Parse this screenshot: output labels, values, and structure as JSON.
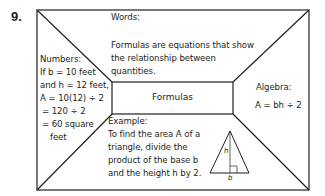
{
  "problem_number": "9.",
  "center": {
    "label": "Formulas"
  },
  "words": {
    "heading": "Words:",
    "lines": [
      "Formulas are equations that show",
      "the relationship between",
      "quantities."
    ]
  },
  "numbers": {
    "heading": "Numbers:",
    "lines": [
      "If b = 10 feet",
      "and h = 12 feet,",
      "A = 10(12) ÷ 2",
      "= 120 ÷ 2",
      "= 60 square",
      "feet"
    ]
  },
  "algebra": {
    "heading": "Algebra:",
    "formula": "A = bh ÷ 2"
  },
  "example": {
    "heading": "Example:",
    "lines": [
      "To find the area A of a",
      "triangle, divide the",
      "product of the base b",
      "and the height h by 2."
    ],
    "figure": {
      "shape": "isosceles-triangle",
      "height_label": "h",
      "base_label": "b"
    }
  },
  "colors": {
    "line": "#231f20",
    "background": "#ffffff"
  }
}
